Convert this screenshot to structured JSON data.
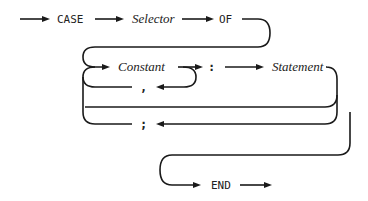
{
  "diagram": {
    "type": "syntax-diagram",
    "nodes": {
      "case_kw": "CASE",
      "selector": "Selector",
      "of_kw": "OF",
      "constant": "Constant",
      "colon": ":",
      "statement": "Statement",
      "comma": ",",
      "semicolon": ";",
      "end_kw": "END"
    },
    "edges": [
      [
        "start",
        "CASE"
      ],
      [
        "CASE",
        "Selector"
      ],
      [
        "Selector",
        "OF"
      ],
      [
        "OF",
        "Constant"
      ],
      [
        "Constant",
        ":"
      ],
      [
        "Constant",
        ","
      ],
      [
        ",",
        "Constant"
      ],
      [
        ":",
        "Statement"
      ],
      [
        "Statement",
        ";"
      ],
      [
        ";",
        "Constant"
      ],
      [
        "Statement",
        "END"
      ],
      [
        "END",
        "exit"
      ]
    ],
    "colors": {
      "line": "#1a1a1a",
      "background": "#ffffff"
    }
  }
}
